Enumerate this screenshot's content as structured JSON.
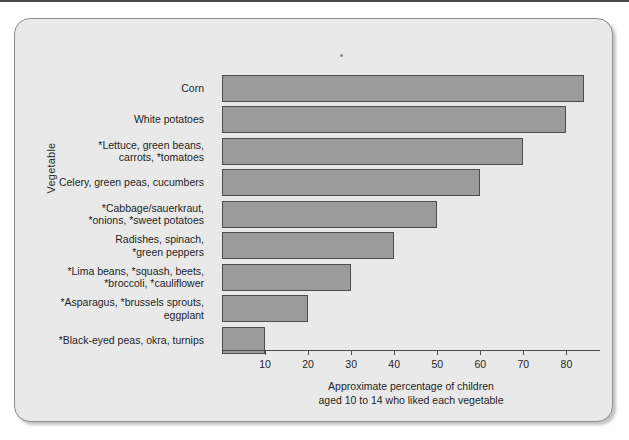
{
  "figure": {
    "background_color": "#e9e9e9",
    "bar_fill_color": "#9b9b9b",
    "bar_border_color": "#4d4d4d",
    "axis_color": "#4a4a4a"
  },
  "chart_data": {
    "type": "bar",
    "orientation": "horizontal",
    "title": "",
    "subtitle": "",
    "xlabel": "Approximate percentage of children\naged 10 to 14 who liked each vegetable",
    "ylabel": "Vegetable",
    "xlim": [
      0,
      88
    ],
    "ylim": [
      0,
      9
    ],
    "grid": false,
    "legend": null,
    "xticks": [
      10,
      20,
      30,
      40,
      50,
      60,
      70,
      80
    ],
    "xtick_labels": [
      "10",
      "20",
      "30",
      "40",
      "50",
      "60",
      "70",
      "80"
    ],
    "categories": [
      "Corn",
      "White potatoes",
      "*Lettuce, green beans,\ncarrots, *tomatoes",
      "Celery, green peas, cucumbers",
      "*Cabbage/sauerkraut,\n*onions, *sweet potatoes",
      "Radishes, spinach,\n*green peppers",
      "*Lima beans, *squash, beets,\n*broccoli, *cauliflower",
      "*Asparagus, *brussels sprouts,\neggplant",
      "*Black-eyed peas, okra, turnips"
    ],
    "values": [
      84,
      80,
      70,
      60,
      50,
      40,
      30,
      20,
      10
    ],
    "value_unit": "percent",
    "annotations": []
  },
  "bars": [
    {
      "label": "Corn",
      "value": 84
    },
    {
      "label": "White potatoes",
      "value": 80
    },
    {
      "label": "*Lettuce, green beans,\ncarrots, *tomatoes",
      "value": 70
    },
    {
      "label": "Celery, green peas, cucumbers",
      "value": 60
    },
    {
      "label": "*Cabbage/sauerkraut,\n*onions, *sweet potatoes",
      "value": 50
    },
    {
      "label": "Radishes, spinach,\n*green peppers",
      "value": 40
    },
    {
      "label": "*Lima beans, *squash, beets,\n*broccoli, *cauliflower",
      "value": 30
    },
    {
      "label": "*Asparagus, *brussels sprouts,\neggplant",
      "value": 20
    },
    {
      "label": "*Black-eyed peas, okra, turnips",
      "value": 10
    }
  ],
  "axis": {
    "y_title": "Vegetable",
    "x_title": "Approximate percentage of children\naged 10 to 14 who liked each vegetable",
    "ticks": [
      {
        "value": 10,
        "label": "10"
      },
      {
        "value": 20,
        "label": "20"
      },
      {
        "value": 30,
        "label": "30"
      },
      {
        "value": 40,
        "label": "40"
      },
      {
        "value": 50,
        "label": "50"
      },
      {
        "value": 60,
        "label": "60"
      },
      {
        "value": 70,
        "label": "70"
      },
      {
        "value": 80,
        "label": "80"
      }
    ]
  }
}
